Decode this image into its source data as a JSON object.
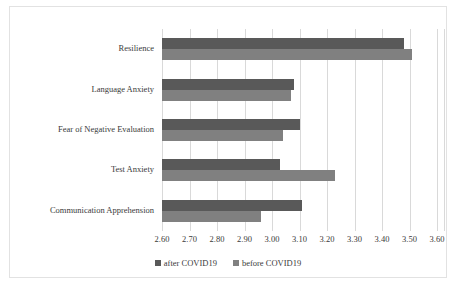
{
  "chart_data": {
    "type": "bar",
    "orientation": "horizontal",
    "title": "",
    "xlabel": "",
    "ylabel": "",
    "xlim": [
      2.6,
      3.6
    ],
    "xticks": [
      "2.60",
      "2.70",
      "2.80",
      "2.90",
      "3.00",
      "3.10",
      "3.20",
      "3.30",
      "3.40",
      "3.50",
      "3.60"
    ],
    "xtick_values": [
      2.6,
      2.7,
      2.8,
      2.9,
      3.0,
      3.1,
      3.2,
      3.3,
      3.4,
      3.5,
      3.6
    ],
    "grid": true,
    "grid_axis": "x",
    "legend_position": "bottom",
    "categories": [
      "Resilience",
      "Language Anxiety",
      "Fear of Negative Evaluation",
      "Test Anxiety",
      "Communication Apprehension"
    ],
    "series": [
      {
        "name": "after COVID19",
        "color": "#595959",
        "values": [
          3.48,
          3.08,
          3.1,
          3.03,
          3.11
        ]
      },
      {
        "name": "before COVID19",
        "color": "#808080",
        "values": [
          3.51,
          3.07,
          3.04,
          3.23,
          2.96
        ]
      }
    ]
  },
  "colors": {
    "after_covid19": "#595959",
    "before_covid19": "#808080",
    "gridline": "#d9d9d9",
    "frame_border": "#e2e2e2",
    "text": "#3a3a3a",
    "background": "#ffffff"
  }
}
